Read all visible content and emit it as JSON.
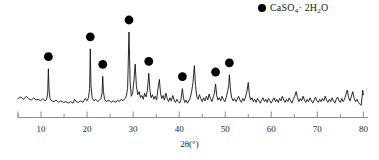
{
  "chart_data": {
    "type": "line",
    "title": "",
    "subtitle": "",
    "xlabel": "2θ(°)",
    "ylabel": "",
    "xlim": [
      5,
      81
    ],
    "ylim": [
      0,
      100
    ],
    "grid": false,
    "legend_position": "top-right",
    "legend": [
      {
        "name": "CaSO4-2H2O",
        "marker": "filled-circle",
        "color": "#000000",
        "text_main": "CaSO",
        "text_sub1": "4",
        "text_mid": "· 2H",
        "text_sub2": "2",
        "text_end": "O"
      }
    ],
    "xticks": [
      10,
      20,
      30,
      40,
      50,
      60,
      70,
      80
    ],
    "xticks_minor": [
      5,
      15,
      25,
      35,
      45,
      55,
      65,
      75
    ],
    "xtick_labels": [
      "10",
      "20",
      "30",
      "40",
      "50",
      "60",
      "70",
      "80"
    ],
    "marked_peaks": [
      {
        "two_theta": 11.6,
        "intensity": 52,
        "marker_y": 66
      },
      {
        "two_theta": 20.7,
        "intensity": 78,
        "marker_y": 92
      },
      {
        "two_theta": 23.4,
        "intensity": 42,
        "marker_y": 55
      },
      {
        "two_theta": 29.1,
        "intensity": 100,
        "marker_y": 98
      },
      {
        "two_theta": 33.4,
        "intensity": 46,
        "marker_y": 62
      },
      {
        "two_theta": 40.7,
        "intensity": 26,
        "marker_y": 39
      },
      {
        "two_theta": 47.9,
        "intensity": 32,
        "marker_y": 45
      },
      {
        "two_theta": 50.9,
        "intensity": 44,
        "marker_y": 60
      }
    ],
    "pattern": [
      [
        5.0,
        13
      ],
      [
        5.6,
        15
      ],
      [
        6.2,
        12
      ],
      [
        6.8,
        16
      ],
      [
        7.3,
        13
      ],
      [
        7.9,
        11
      ],
      [
        8.4,
        14
      ],
      [
        8.9,
        11
      ],
      [
        9.4,
        12
      ],
      [
        9.9,
        10
      ],
      [
        10.4,
        13
      ],
      [
        10.9,
        10
      ],
      [
        11.2,
        12
      ],
      [
        11.45,
        20
      ],
      [
        11.6,
        52
      ],
      [
        11.75,
        24
      ],
      [
        11.95,
        13
      ],
      [
        12.3,
        10
      ],
      [
        12.8,
        9
      ],
      [
        13.3,
        11
      ],
      [
        13.8,
        8
      ],
      [
        14.3,
        10
      ],
      [
        14.9,
        8
      ],
      [
        15.4,
        9
      ],
      [
        15.9,
        7
      ],
      [
        16.4,
        9
      ],
      [
        16.9,
        7
      ],
      [
        17.3,
        12
      ],
      [
        17.6,
        9
      ],
      [
        18.1,
        8
      ],
      [
        18.6,
        10
      ],
      [
        19.1,
        8
      ],
      [
        19.6,
        13
      ],
      [
        20.0,
        10
      ],
      [
        20.3,
        14
      ],
      [
        20.55,
        26
      ],
      [
        20.7,
        78
      ],
      [
        20.85,
        30
      ],
      [
        21.1,
        14
      ],
      [
        21.5,
        10
      ],
      [
        21.9,
        12
      ],
      [
        22.3,
        9
      ],
      [
        22.7,
        11
      ],
      [
        23.0,
        13
      ],
      [
        23.25,
        20
      ],
      [
        23.4,
        42
      ],
      [
        23.55,
        22
      ],
      [
        23.8,
        12
      ],
      [
        24.2,
        9
      ],
      [
        24.7,
        11
      ],
      [
        25.2,
        8
      ],
      [
        25.7,
        10
      ],
      [
        26.2,
        8
      ],
      [
        26.6,
        11
      ],
      [
        27.0,
        9
      ],
      [
        27.4,
        12
      ],
      [
        27.8,
        10
      ],
      [
        28.2,
        13
      ],
      [
        28.5,
        16
      ],
      [
        28.8,
        26
      ],
      [
        29.1,
        100
      ],
      [
        29.35,
        34
      ],
      [
        29.6,
        16
      ],
      [
        29.9,
        20
      ],
      [
        30.2,
        38
      ],
      [
        30.45,
        58
      ],
      [
        30.7,
        30
      ],
      [
        31.0,
        18
      ],
      [
        31.3,
        22
      ],
      [
        31.6,
        14
      ],
      [
        31.9,
        17
      ],
      [
        32.2,
        12
      ],
      [
        32.5,
        20
      ],
      [
        32.8,
        15
      ],
      [
        33.1,
        24
      ],
      [
        33.4,
        46
      ],
      [
        33.65,
        24
      ],
      [
        33.9,
        14
      ],
      [
        34.2,
        18
      ],
      [
        34.5,
        12
      ],
      [
        34.8,
        16
      ],
      [
        35.1,
        11
      ],
      [
        35.4,
        26
      ],
      [
        35.7,
        38
      ],
      [
        35.95,
        20
      ],
      [
        36.2,
        13
      ],
      [
        36.5,
        17
      ],
      [
        36.8,
        11
      ],
      [
        37.1,
        20
      ],
      [
        37.4,
        13
      ],
      [
        37.7,
        9
      ],
      [
        38.0,
        14
      ],
      [
        38.3,
        10
      ],
      [
        38.6,
        17
      ],
      [
        38.9,
        11
      ],
      [
        39.2,
        8
      ],
      [
        39.5,
        12
      ],
      [
        39.8,
        9
      ],
      [
        40.1,
        7
      ],
      [
        40.4,
        12
      ],
      [
        40.7,
        26
      ],
      [
        40.95,
        13
      ],
      [
        41.2,
        8
      ],
      [
        41.5,
        11
      ],
      [
        41.8,
        7
      ],
      [
        42.1,
        10
      ],
      [
        42.4,
        14
      ],
      [
        42.7,
        22
      ],
      [
        43.0,
        34
      ],
      [
        43.3,
        56
      ],
      [
        43.55,
        30
      ],
      [
        43.8,
        16
      ],
      [
        44.1,
        12
      ],
      [
        44.4,
        18
      ],
      [
        44.7,
        13
      ],
      [
        45.0,
        9
      ],
      [
        45.3,
        14
      ],
      [
        45.6,
        10
      ],
      [
        45.9,
        16
      ],
      [
        46.2,
        11
      ],
      [
        46.5,
        19
      ],
      [
        46.8,
        13
      ],
      [
        47.1,
        9
      ],
      [
        47.4,
        15
      ],
      [
        47.65,
        20
      ],
      [
        47.9,
        32
      ],
      [
        48.15,
        17
      ],
      [
        48.4,
        11
      ],
      [
        48.7,
        14
      ],
      [
        49.0,
        10
      ],
      [
        49.3,
        16
      ],
      [
        49.6,
        12
      ],
      [
        49.9,
        9
      ],
      [
        50.2,
        14
      ],
      [
        50.5,
        22
      ],
      [
        50.75,
        30
      ],
      [
        50.9,
        44
      ],
      [
        51.15,
        24
      ],
      [
        51.4,
        14
      ],
      [
        51.7,
        10
      ],
      [
        52.0,
        13
      ],
      [
        52.3,
        9
      ],
      [
        52.6,
        12
      ],
      [
        52.9,
        16
      ],
      [
        53.2,
        11
      ],
      [
        53.5,
        8
      ],
      [
        53.8,
        13
      ],
      [
        54.1,
        10
      ],
      [
        54.4,
        15
      ],
      [
        54.7,
        22
      ],
      [
        55.0,
        34
      ],
      [
        55.25,
        18
      ],
      [
        55.5,
        11
      ],
      [
        55.8,
        14
      ],
      [
        56.1,
        9
      ],
      [
        56.4,
        12
      ],
      [
        56.7,
        8
      ],
      [
        57.0,
        13
      ],
      [
        57.3,
        10
      ],
      [
        57.6,
        7
      ],
      [
        57.9,
        11
      ],
      [
        58.2,
        14
      ],
      [
        58.5,
        9
      ],
      [
        58.8,
        12
      ],
      [
        59.1,
        8
      ],
      [
        59.4,
        13
      ],
      [
        59.7,
        10
      ],
      [
        60.0,
        7
      ],
      [
        60.3,
        11
      ],
      [
        60.6,
        14
      ],
      [
        60.9,
        9
      ],
      [
        61.2,
        12
      ],
      [
        61.5,
        8
      ],
      [
        61.8,
        13
      ],
      [
        62.1,
        10
      ],
      [
        62.4,
        16
      ],
      [
        62.7,
        11
      ],
      [
        63.0,
        8
      ],
      [
        63.3,
        12
      ],
      [
        63.6,
        9
      ],
      [
        63.9,
        14
      ],
      [
        64.2,
        10
      ],
      [
        64.5,
        7
      ],
      [
        64.8,
        12
      ],
      [
        65.1,
        16
      ],
      [
        65.4,
        22
      ],
      [
        65.7,
        14
      ],
      [
        66.0,
        9
      ],
      [
        66.3,
        13
      ],
      [
        66.6,
        10
      ],
      [
        66.9,
        16
      ],
      [
        67.2,
        11
      ],
      [
        67.5,
        8
      ],
      [
        67.8,
        12
      ],
      [
        68.1,
        9
      ],
      [
        68.4,
        14
      ],
      [
        68.7,
        10
      ],
      [
        69.0,
        7
      ],
      [
        69.3,
        11
      ],
      [
        69.6,
        15
      ],
      [
        69.9,
        10
      ],
      [
        70.2,
        8
      ],
      [
        70.5,
        12
      ],
      [
        70.8,
        9
      ],
      [
        71.1,
        13
      ],
      [
        71.4,
        10
      ],
      [
        71.7,
        16
      ],
      [
        72.0,
        11
      ],
      [
        72.3,
        8
      ],
      [
        72.6,
        12
      ],
      [
        72.9,
        9
      ],
      [
        73.2,
        14
      ],
      [
        73.5,
        10
      ],
      [
        73.8,
        7
      ],
      [
        74.1,
        12
      ],
      [
        74.4,
        15
      ],
      [
        74.7,
        10
      ],
      [
        75.0,
        8
      ],
      [
        75.3,
        13
      ],
      [
        75.6,
        9
      ],
      [
        75.9,
        12
      ],
      [
        76.2,
        18
      ],
      [
        76.5,
        24
      ],
      [
        76.8,
        14
      ],
      [
        77.1,
        10
      ],
      [
        77.4,
        16
      ],
      [
        77.7,
        22
      ],
      [
        78.0,
        13
      ],
      [
        78.3,
        9
      ],
      [
        78.6,
        12
      ],
      [
        78.9,
        8
      ],
      [
        79.2,
        6
      ],
      [
        79.5,
        4
      ],
      [
        79.7,
        14
      ],
      [
        79.85,
        24
      ],
      [
        80.0,
        18
      ]
    ]
  }
}
